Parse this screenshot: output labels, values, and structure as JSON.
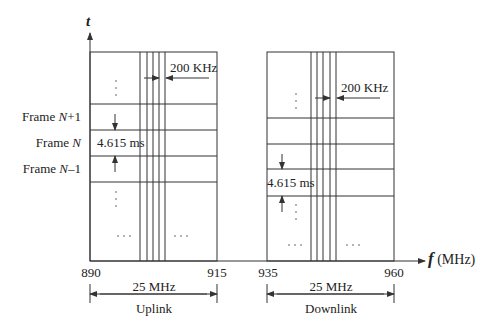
{
  "diagram": {
    "axes": {
      "y_label": "t",
      "x_label_var": "f",
      "x_label_unit": "(MHz)"
    },
    "frames": {
      "next": {
        "prefix": "Frame ",
        "var": "N",
        "suffix": "+1"
      },
      "current": {
        "prefix": "Frame ",
        "var": "N",
        "suffix": ""
      },
      "prev": {
        "prefix": "Frame ",
        "var": "N",
        "suffix": "–1"
      }
    },
    "uplink": {
      "label": "Uplink",
      "start": "890",
      "end": "915",
      "bandwidth": "25 MHz",
      "channel_spacing": "200 KHz",
      "frame_duration": "4.615 ms"
    },
    "downlink": {
      "label": "Downlink",
      "start": "935",
      "end": "960",
      "bandwidth": "25 MHz",
      "channel_spacing": "200 KHz",
      "frame_duration": "4.615 ms"
    },
    "ellipsis_h": "· · ·",
    "colors": {
      "line": "#333333",
      "background": "#ffffff"
    }
  }
}
